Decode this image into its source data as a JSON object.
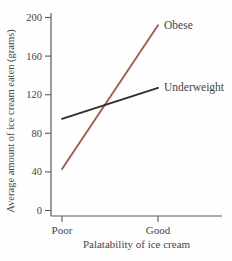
{
  "chart_data": {
    "type": "line",
    "title": "",
    "xlabel": "Palatability of ice cream",
    "ylabel": "Average amount of ice cream eaten (grams)",
    "categories": [
      "Poor",
      "Good"
    ],
    "yticks": [
      0,
      40,
      80,
      120,
      160,
      200
    ],
    "ylim": [
      0,
      200
    ],
    "grid": false,
    "legend_position": "inline-right-of-line-end",
    "series": [
      {
        "name": "Obese",
        "values": [
          43,
          192
        ],
        "color": "#af5849"
      },
      {
        "name": "Underweight",
        "values": [
          95,
          127
        ],
        "color": "#2e2c2c"
      }
    ]
  },
  "colors": {
    "background": "#fefefe",
    "axis": "#5a5a5a",
    "text": "#454545",
    "obese_line": "#af5849",
    "underweight_line": "#2e2c2c"
  }
}
